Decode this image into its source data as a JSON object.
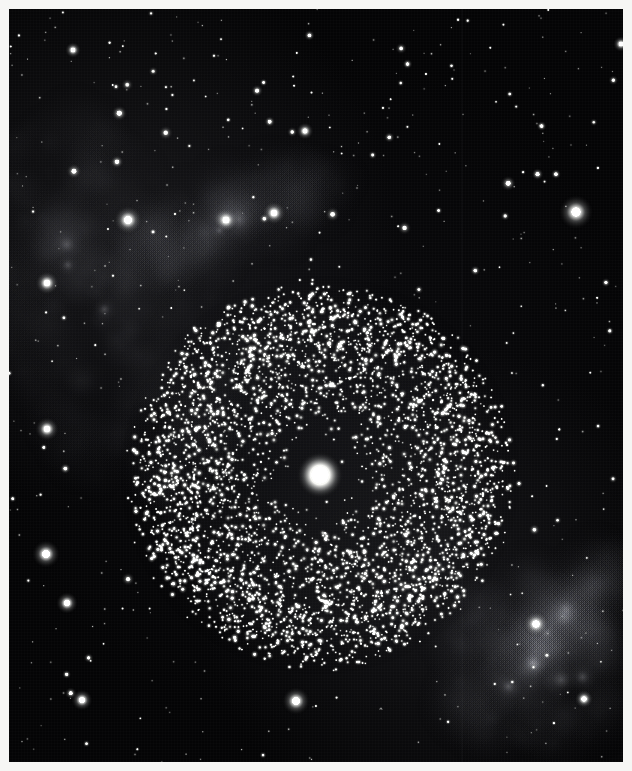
{
  "image": {
    "kind": "astronomical-photographic-plate",
    "width": 632,
    "height": 771,
    "border_color": "#f6f6f4",
    "border_width_px": 9,
    "sky_background_color": "#050506",
    "star_color": "#e8e9e6",
    "nebula_color": "#9fa0a6",
    "caption": ""
  },
  "sky": {
    "width": 614,
    "height": 753,
    "background": "#040405",
    "grain_opacity": 0.35,
    "field_star_count": 190,
    "faint_grain_star_count": 420
  },
  "artifacts": {
    "scanline": {
      "name": "vertical-plate-scratch",
      "x": 452,
      "width": 2,
      "color": "#7a7c82",
      "opacity": 0.3
    }
  },
  "cluster": {
    "name": "globular-cluster",
    "center_x": 311,
    "center_y": 466,
    "radius_x": 196,
    "radius_y": 196,
    "star_count": 4200,
    "core_star": {
      "name": "bright-central-star",
      "x": 311,
      "y": 466,
      "radius": 9,
      "color": "#f2f2ee"
    },
    "rim_brightening": 1.35,
    "star_min_radius": 0.8,
    "star_max_radius": 2.1
  },
  "nebulae": [
    {
      "name": "upper-left-nebula-complex",
      "cx": 95,
      "cy": 300,
      "rx": 110,
      "ry": 200,
      "rotation_deg": -18,
      "intensity": 0.42,
      "color": "#aeb0b8"
    },
    {
      "name": "upper-left-nebula-streak",
      "cx": 215,
      "cy": 215,
      "rx": 130,
      "ry": 40,
      "rotation_deg": -22,
      "intensity": 0.38,
      "color": "#b4b6be"
    },
    {
      "name": "lower-right-nebula-complex",
      "cx": 525,
      "cy": 655,
      "rx": 95,
      "ry": 90,
      "rotation_deg": 35,
      "intensity": 0.5,
      "color": "#b8bac2"
    },
    {
      "name": "lower-right-nebula-filament",
      "cx": 560,
      "cy": 600,
      "rx": 80,
      "ry": 30,
      "rotation_deg": -45,
      "intensity": 0.3,
      "color": "#a8aab2"
    }
  ],
  "bright_field_stars": [
    {
      "name": "bright-star-upper-right",
      "x": 567,
      "y": 203,
      "r": 5.2
    },
    {
      "name": "bright-star-upper-left-nebula",
      "x": 119,
      "y": 211,
      "r": 4.4
    },
    {
      "name": "bright-star-nebula-knot-a",
      "x": 217,
      "y": 211,
      "r": 3.8
    },
    {
      "name": "bright-star-nebula-knot-b",
      "x": 265,
      "y": 204,
      "r": 3.6
    },
    {
      "name": "bright-star-left-edge",
      "x": 38,
      "y": 274,
      "r": 3.6
    },
    {
      "name": "bright-star-left-mid",
      "x": 38,
      "y": 420,
      "r": 3.6
    },
    {
      "name": "bright-star-left-lower",
      "x": 37,
      "y": 545,
      "r": 4.2
    },
    {
      "name": "bright-star-left-bottom",
      "x": 58,
      "y": 594,
      "r": 3.3
    },
    {
      "name": "bright-star-below-cluster",
      "x": 287,
      "y": 692,
      "r": 4.2
    },
    {
      "name": "bright-star-lower-right-nebula",
      "x": 527,
      "y": 615,
      "r": 4.0
    },
    {
      "name": "bright-star-lower-left",
      "x": 73,
      "y": 691,
      "r": 3.2
    },
    {
      "name": "bright-star-right-lower",
      "x": 575,
      "y": 690,
      "r": 2.8
    },
    {
      "name": "bright-star-upper-mid",
      "x": 296,
      "y": 122,
      "r": 2.6
    },
    {
      "name": "bright-star-top-left",
      "x": 64,
      "y": 41,
      "r": 2.4
    },
    {
      "name": "bright-star-upper-far-right",
      "x": 612,
      "y": 35,
      "r": 2.4
    }
  ],
  "accessibility": {
    "alt": "Black and white photographic plate of a rich globular star cluster with a bright star at its centre, set in a sparse star field with faint wispy nebulosity at upper left and lower right."
  }
}
